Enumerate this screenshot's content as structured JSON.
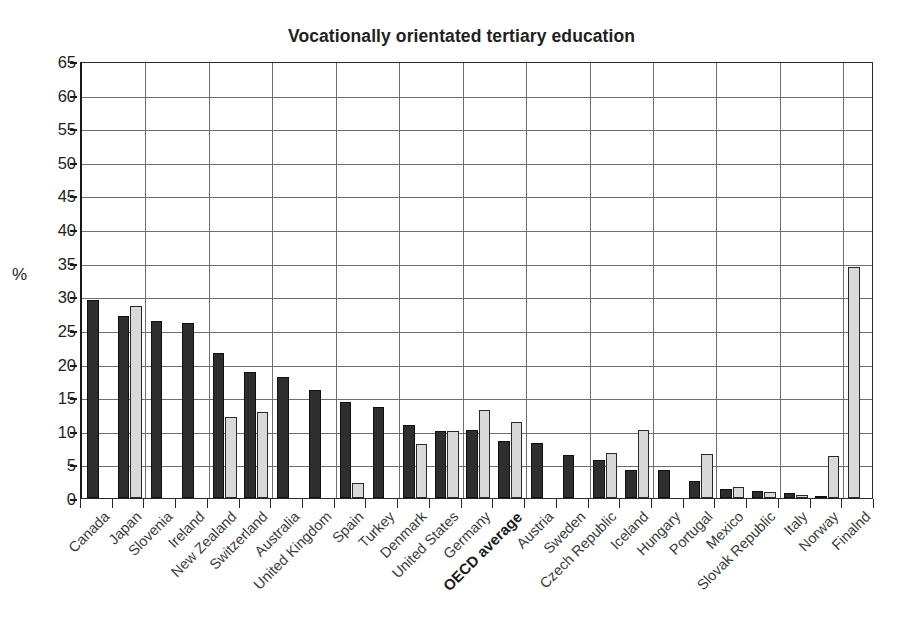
{
  "chart_data": {
    "type": "bar",
    "title": "Vocationally orientated tertiary education",
    "xlabel": "",
    "ylabel": "%",
    "ylim": [
      0,
      65
    ],
    "yticks": [
      0,
      5,
      10,
      15,
      20,
      25,
      30,
      35,
      40,
      45,
      50,
      55,
      60,
      65
    ],
    "grid": true,
    "legend_position": "none",
    "categories": [
      "Canada",
      "Japan",
      "Slovenia",
      "Ireland",
      "New Zealand",
      "Switzerland",
      "Australia",
      "United Kingdom",
      "Spain",
      "Turkey",
      "Denmark",
      "United States",
      "Germany",
      "OECD average",
      "Austria",
      "Sweden",
      "Czech Republic",
      "Iceland",
      "Hungary",
      "Portugal",
      "Mexico",
      "Slovak Republic",
      "Italy",
      "Norway",
      "Finalnd"
    ],
    "highlight_category": "OECD average",
    "series": [
      {
        "name": "dark",
        "color": "#2e2e2e",
        "values": [
          29.5,
          27.0,
          26.3,
          26.0,
          21.5,
          18.7,
          18.0,
          16.0,
          14.3,
          13.6,
          10.8,
          10.0,
          10.1,
          8.5,
          8.2,
          6.4,
          5.6,
          4.2,
          4.2,
          2.5,
          1.3,
          1.1,
          0.7,
          0.3,
          0.0
        ]
      },
      {
        "name": "light",
        "color": "#d9d9d9",
        "values": [
          0.0,
          28.5,
          0.0,
          0.0,
          12.0,
          12.8,
          0.0,
          0.0,
          2.2,
          0.0,
          8.0,
          9.9,
          13.1,
          11.3,
          0.0,
          0.0,
          6.7,
          10.1,
          0.0,
          6.6,
          1.6,
          0.9,
          0.4,
          6.2,
          34.3
        ]
      }
    ]
  },
  "axis": {
    "y_unit_label": "%"
  }
}
